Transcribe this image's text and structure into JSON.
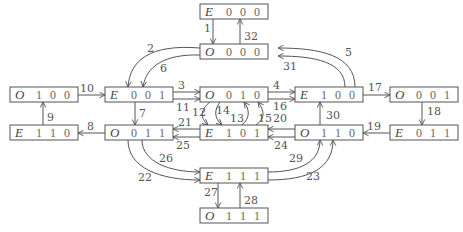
{
  "diagram": {
    "title": "",
    "nodes": [
      {
        "id": "E000",
        "parity": "E",
        "bits": [
          "0",
          "0",
          "0"
        ],
        "x": 200,
        "y": 4
      },
      {
        "id": "O000",
        "parity": "O",
        "bits": [
          "0",
          "0",
          "0"
        ],
        "x": 200,
        "y": 44
      },
      {
        "id": "O100",
        "parity": "O",
        "bits": [
          "1",
          "0",
          "0"
        ],
        "x": 10,
        "y": 87
      },
      {
        "id": "E001",
        "parity": "E",
        "bits": [
          "0",
          "0",
          "1"
        ],
        "x": 105,
        "y": 87
      },
      {
        "id": "O010",
        "parity": "O",
        "bits": [
          "0",
          "1",
          "0"
        ],
        "x": 200,
        "y": 87
      },
      {
        "id": "E100",
        "parity": "E",
        "bits": [
          "1",
          "0",
          "0"
        ],
        "x": 295,
        "y": 87
      },
      {
        "id": "O001",
        "parity": "O",
        "bits": [
          "0",
          "0",
          "1"
        ],
        "x": 390,
        "y": 87
      },
      {
        "id": "E110",
        "parity": "E",
        "bits": [
          "1",
          "1",
          "0"
        ],
        "x": 10,
        "y": 125
      },
      {
        "id": "O011",
        "parity": "O",
        "bits": [
          "0",
          "1",
          "1"
        ],
        "x": 105,
        "y": 125
      },
      {
        "id": "E101",
        "parity": "E",
        "bits": [
          "1",
          "0",
          "1"
        ],
        "x": 200,
        "y": 125
      },
      {
        "id": "O110",
        "parity": "O",
        "bits": [
          "1",
          "1",
          "0"
        ],
        "x": 295,
        "y": 125
      },
      {
        "id": "E011",
        "parity": "E",
        "bits": [
          "0",
          "1",
          "1"
        ],
        "x": 390,
        "y": 125
      },
      {
        "id": "E111",
        "parity": "E",
        "bits": [
          "1",
          "1",
          "1"
        ],
        "x": 200,
        "y": 168
      },
      {
        "id": "O111",
        "parity": "O",
        "bits": [
          "1",
          "1",
          "1"
        ],
        "x": 200,
        "y": 208
      }
    ],
    "edges": [
      {
        "label": "1",
        "from": "E000",
        "to": "O000"
      },
      {
        "label": "2",
        "from": "O000",
        "to": "E001"
      },
      {
        "label": "3",
        "from": "E001",
        "to": "O010"
      },
      {
        "label": "4",
        "from": "O010",
        "to": "E100"
      },
      {
        "label": "5",
        "from": "E100",
        "to": "O000"
      },
      {
        "label": "6",
        "from": "O000",
        "to": "E001"
      },
      {
        "label": "7",
        "from": "E001",
        "to": "O011"
      },
      {
        "label": "8",
        "from": "O011",
        "to": "E110"
      },
      {
        "label": "9",
        "from": "E110",
        "to": "O100"
      },
      {
        "label": "10",
        "from": "O100",
        "to": "E001"
      },
      {
        "label": "11",
        "from": "E001",
        "to": "O010"
      },
      {
        "label": "12",
        "from": "O010",
        "to": "E101"
      },
      {
        "label": "13",
        "from": "E101",
        "to": "O010"
      },
      {
        "label": "14",
        "from": "O010",
        "to": "E101"
      },
      {
        "label": "15",
        "from": "E101",
        "to": "O010"
      },
      {
        "label": "16",
        "from": "O010",
        "to": "E100"
      },
      {
        "label": "17",
        "from": "E100",
        "to": "O001"
      },
      {
        "label": "18",
        "from": "O001",
        "to": "E011"
      },
      {
        "label": "19",
        "from": "E011",
        "to": "O110"
      },
      {
        "label": "20",
        "from": "O110",
        "to": "E101"
      },
      {
        "label": "21",
        "from": "E101",
        "to": "O011"
      },
      {
        "label": "22",
        "from": "O011",
        "to": "E111"
      },
      {
        "label": "23",
        "from": "E111",
        "to": "O110"
      },
      {
        "label": "24",
        "from": "O110",
        "to": "E101"
      },
      {
        "label": "25",
        "from": "E101",
        "to": "O011"
      },
      {
        "label": "26",
        "from": "O011",
        "to": "E111"
      },
      {
        "label": "27",
        "from": "E111",
        "to": "O111"
      },
      {
        "label": "28",
        "from": "O111",
        "to": "E111"
      },
      {
        "label": "29",
        "from": "E111",
        "to": "O110"
      },
      {
        "label": "30",
        "from": "O110",
        "to": "E100"
      },
      {
        "label": "31",
        "from": "E100",
        "to": "O000"
      },
      {
        "label": "32",
        "from": "O000",
        "to": "E000"
      }
    ]
  }
}
